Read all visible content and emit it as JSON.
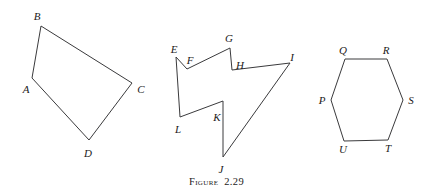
{
  "figure": {
    "caption": "Figure  2.29",
    "background_color": "#ffffff",
    "stroke_color": "#3a3a3c",
    "label_color": "#1c1a1a",
    "width": 433,
    "height": 196
  },
  "chart_data": {
    "type": "diagram",
    "title": "Figure  2.29",
    "grid": false,
    "legend": "none",
    "xlim": [
      0,
      433
    ],
    "ylim": [
      0,
      196
    ],
    "shapes": [
      {
        "name": "quadrilateral-abcd",
        "closed": true,
        "vertex_count": 4,
        "vertices": [
          {
            "label": "A",
            "x": 32,
            "y": 78,
            "label_x": 26,
            "label_y": 89
          },
          {
            "label": "B",
            "x": 41,
            "y": 26,
            "label_x": 37,
            "label_y": 16
          },
          {
            "label": "C",
            "x": 132,
            "y": 83,
            "label_x": 141,
            "label_y": 89
          },
          {
            "label": "D",
            "x": 89,
            "y": 140,
            "label_x": 88,
            "label_y": 153
          }
        ],
        "edges": [
          "A-B",
          "B-C",
          "C-D",
          "D-A"
        ]
      },
      {
        "name": "concave-polygon-efghijkl",
        "closed": true,
        "vertex_count": 8,
        "vertices": [
          {
            "label": "E",
            "x": 176,
            "y": 57,
            "label_x": 174,
            "label_y": 49
          },
          {
            "label": "F",
            "x": 187,
            "y": 69,
            "label_x": 190,
            "label_y": 60
          },
          {
            "label": "G",
            "x": 230,
            "y": 48,
            "label_x": 229,
            "label_y": 38
          },
          {
            "label": "H",
            "x": 232,
            "y": 70,
            "label_x": 240,
            "label_y": 65
          },
          {
            "label": "I",
            "x": 290,
            "y": 63,
            "label_x": 292,
            "label_y": 57
          },
          {
            "label": "J",
            "x": 223,
            "y": 157,
            "label_x": 221,
            "label_y": 169
          },
          {
            "label": "K",
            "x": 223,
            "y": 101,
            "label_x": 217,
            "label_y": 117
          },
          {
            "label": "L",
            "x": 180,
            "y": 117,
            "label_x": 178,
            "label_y": 129
          }
        ],
        "edges": [
          "E-F",
          "F-G",
          "G-H",
          "H-I",
          "I-J",
          "J-K",
          "K-L",
          "L-E"
        ]
      },
      {
        "name": "hexagon-pqrstu",
        "closed": true,
        "vertex_count": 6,
        "vertices": [
          {
            "label": "P",
            "x": 331,
            "y": 100,
            "label_x": 322,
            "label_y": 100
          },
          {
            "label": "Q",
            "x": 345,
            "y": 59,
            "label_x": 343,
            "label_y": 50
          },
          {
            "label": "R",
            "x": 387,
            "y": 59,
            "label_x": 386,
            "label_y": 50
          },
          {
            "label": "S",
            "x": 403,
            "y": 100,
            "label_x": 411,
            "label_y": 100
          },
          {
            "label": "T",
            "x": 388,
            "y": 140,
            "label_x": 388,
            "label_y": 148
          },
          {
            "label": "U",
            "x": 344,
            "y": 141,
            "label_x": 343,
            "label_y": 149
          }
        ],
        "edges": [
          "P-Q",
          "Q-R",
          "R-S",
          "S-T",
          "T-U",
          "U-P"
        ]
      }
    ]
  }
}
